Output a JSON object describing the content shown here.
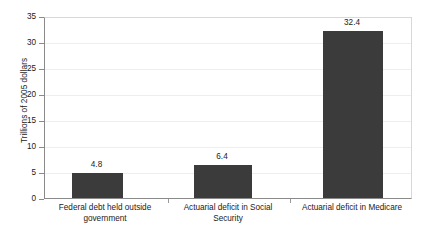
{
  "chart_data": {
    "type": "bar",
    "title": "",
    "subtitle": "",
    "xlabel": "",
    "ylabel": "Trillions of 2005 dollars",
    "categories": [
      "Federal debt held outside government",
      "Actuarial deficit in Social Security",
      "Actuarial deficit in Medicare"
    ],
    "values": [
      4.8,
      6.4,
      32.4
    ],
    "value_labels": [
      "4.8",
      "6.4",
      "32.4"
    ],
    "ylim": [
      0,
      35
    ],
    "ytick_labels": [
      "0",
      "5",
      "10",
      "15",
      "20",
      "25",
      "30",
      "35"
    ],
    "ytick_values": [
      0,
      5,
      10,
      15,
      20,
      25,
      30,
      35
    ],
    "grid": true,
    "grid_axis": "y",
    "legend": false,
    "legend_position": "none",
    "bar_color": "#3b3b3b",
    "plot_background": "#ffffff",
    "gridline_color": "#eeeeee",
    "axis_color": "#8a8a8a"
  },
  "axis": {
    "y_title": "Trillions of 2005 dollars"
  },
  "categories_wrapped": [
    [
      "Federal debt held outside",
      "government"
    ],
    [
      "Actuarial deficit in Social",
      "Security"
    ],
    [
      "Actuarial deficit in Medicare",
      ""
    ]
  ]
}
